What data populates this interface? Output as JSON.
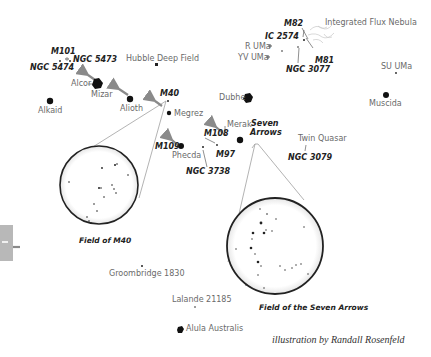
{
  "credit": "illustration by Randall Rosenfeld",
  "labels": {
    "m101": "M101",
    "ngc5473": "NGC 5473",
    "ngc5474": "NGC 5474",
    "hubble": "Hubble Deep Field",
    "alcor": "Alcor",
    "mizar": "Mizar",
    "alkaid": "Alkaid",
    "alioth": "Alioth",
    "m40": "M40",
    "megrez": "Megrez",
    "m109": "M109",
    "phecda": "Phecda",
    "ngc3738": "NGC 3738",
    "m108": "M108",
    "m97": "M97",
    "merak": "Merak",
    "seven_arrows_1": "Seven",
    "seven_arrows_2": "Arrows",
    "dubhe": "Dubhe",
    "m82": "M82",
    "ic2574": "IC 2574",
    "rurma": "R UMa",
    "yvuma": "YV UMa",
    "m81": "M81",
    "ngc3077": "NGC 3077",
    "ifn": "Integrated Flux Nebula",
    "suuma": "SU UMa",
    "muscida": "Muscida",
    "twin_quasar": "Twin Quasar",
    "ngc3079": "NGC 3079",
    "groombridge": "Groombridge 1830",
    "lalande": "Lalande 21185",
    "alula": "Alula Australis"
  },
  "captions": {
    "field_m40": "Field of M40",
    "field_seven_arrows": "Field of the Seven Arrows"
  },
  "colors": {
    "star": "#111111",
    "label": "#6a6a6a",
    "bold_label": "#222222",
    "arrow": "#8a8a8a",
    "line": "#9a9a9a"
  }
}
